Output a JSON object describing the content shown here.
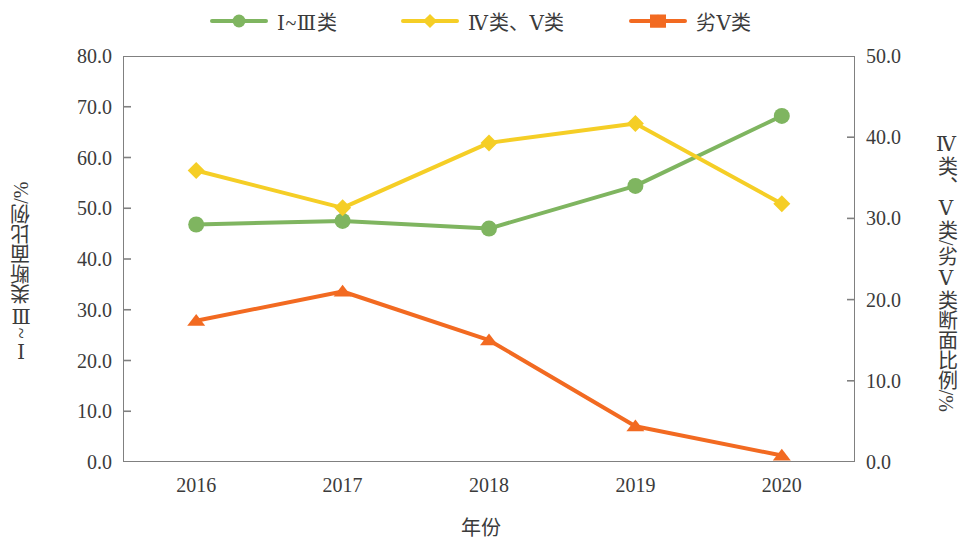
{
  "chart_data": {
    "type": "line",
    "title": "",
    "xlabel": "年份",
    "categories": [
      "2016",
      "2017",
      "2018",
      "2019",
      "2020"
    ],
    "grid": false,
    "legend_position": "top-center",
    "axes": {
      "left": {
        "label": "Ⅰ~Ⅲ类断面比例/%",
        "min": 0.0,
        "max": 80.0,
        "step": 10.0,
        "ticks": [
          "0.0",
          "10.0",
          "20.0",
          "30.0",
          "40.0",
          "50.0",
          "60.0",
          "70.0",
          "80.0"
        ]
      },
      "right": {
        "label": "Ⅳ类、Ⅴ类/劣Ⅴ类断面比例/%",
        "min": 0.0,
        "max": 50.0,
        "step": 10.0,
        "ticks": [
          "0.0",
          "10.0",
          "20.0",
          "30.0",
          "40.0",
          "50.0"
        ]
      }
    },
    "series": [
      {
        "name": "Ⅰ~Ⅲ类",
        "axis": "left",
        "color": "#7FB560",
        "marker": "circle",
        "values": [
          46.8,
          47.5,
          46.0,
          54.4,
          68.2
        ]
      },
      {
        "name": "Ⅳ类、Ⅴ类",
        "axis": "right",
        "color": "#F5CE26",
        "marker": "diamond",
        "values": [
          35.9,
          31.3,
          39.3,
          41.7,
          31.8
        ]
      },
      {
        "name": "劣Ⅴ类",
        "axis": "right",
        "color": "#F26A21",
        "marker": "triangle",
        "values": [
          17.4,
          21.0,
          15.0,
          4.4,
          0.8
        ]
      }
    ]
  },
  "legend": {
    "entries": [
      {
        "label": "Ⅰ~Ⅲ类",
        "color": "#7FB560",
        "marker": "circle-icon"
      },
      {
        "label": "Ⅳ类、Ⅴ类",
        "color": "#F5CE26",
        "marker": "diamond-icon"
      },
      {
        "label": "劣Ⅴ类",
        "color": "#F26A21",
        "marker": "triangle-icon"
      }
    ]
  }
}
